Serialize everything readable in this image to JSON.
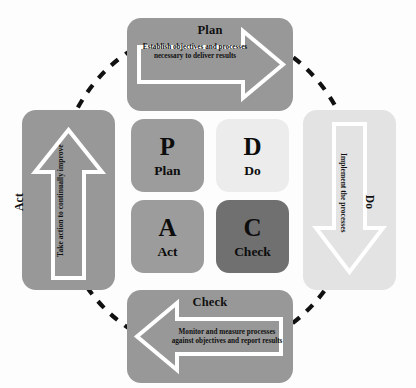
{
  "diagram": {
    "background_color": "#fdfdfd",
    "cycle_ring": {
      "name": "dashed-cycle-ellipse",
      "style": "dashed",
      "color": "#111111"
    },
    "phases": [
      {
        "key": "plan",
        "title": "Plan",
        "description": "Establish objectives and processes necessary to deliver results",
        "arrow_direction": "right",
        "panel_color": "#989898",
        "arrow_outline_color": "#ffffff"
      },
      {
        "key": "do",
        "title": "Do",
        "description": "Implement the processes",
        "arrow_direction": "down",
        "panel_color": "#e3e3e3",
        "arrow_outline_color": "#ffffff"
      },
      {
        "key": "check",
        "title": "Check",
        "description": "Monitor and measure processes against objectives and report results",
        "arrow_direction": "left",
        "panel_color": "#989898",
        "arrow_outline_color": "#ffffff"
      },
      {
        "key": "act",
        "title": "Act",
        "description": "Take action to continually improve",
        "arrow_direction": "up",
        "panel_color": "#989898",
        "arrow_outline_color": "#ffffff"
      }
    ],
    "center_grid": [
      {
        "key": "p",
        "letter": "P",
        "word": "Plan",
        "color": "#9c9c9c"
      },
      {
        "key": "d",
        "letter": "D",
        "word": "Do",
        "color": "#ececec"
      },
      {
        "key": "a",
        "letter": "A",
        "word": "Act",
        "color": "#9c9c9c"
      },
      {
        "key": "c",
        "letter": "C",
        "word": "Check",
        "color": "#707070"
      }
    ]
  }
}
